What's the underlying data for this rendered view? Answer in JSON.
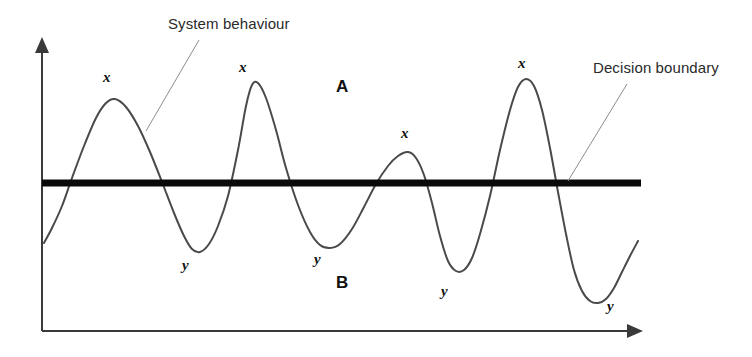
{
  "figure": {
    "background_color": "#ffffff"
  },
  "callouts": [
    {
      "name": "system-behaviour",
      "text": "System behaviour",
      "x": 168,
      "y": 16,
      "leader": {
        "x1": 199,
        "y1": 40,
        "x2": 146,
        "y2": 131
      },
      "color": "#2a2a2a"
    },
    {
      "name": "decision-boundary",
      "text": "Decision boundary",
      "x": 593,
      "y": 60,
      "leader": {
        "x1": 627,
        "y1": 84,
        "x2": 568,
        "y2": 181
      },
      "color": "#2a2a2a"
    }
  ],
  "regions": [
    {
      "name": "region-a",
      "text": "A",
      "x": 336,
      "y": 78
    },
    {
      "name": "region-b",
      "text": "B",
      "x": 336,
      "y": 274
    }
  ],
  "point_labels": [
    {
      "name": "peak-1",
      "text": "x",
      "x": 103,
      "y": 70
    },
    {
      "name": "trough-1",
      "text": "y",
      "x": 182,
      "y": 258
    },
    {
      "name": "peak-2",
      "text": "x",
      "x": 239,
      "y": 60
    },
    {
      "name": "trough-2",
      "text": "y",
      "x": 314,
      "y": 252
    },
    {
      "name": "peak-3",
      "text": "x",
      "x": 401,
      "y": 126
    },
    {
      "name": "trough-3",
      "text": "y",
      "x": 441,
      "y": 284
    },
    {
      "name": "peak-4",
      "text": "x",
      "x": 518,
      "y": 56
    },
    {
      "name": "trough-4",
      "text": "y",
      "x": 607,
      "y": 299
    }
  ],
  "axes": {
    "color": "#3a3a3a",
    "stroke_width": 2,
    "y_axis": {
      "x": 42,
      "y_top": 37,
      "y_bottom": 331
    },
    "x_axis": {
      "y": 331,
      "x_left": 42,
      "x_right": 643
    }
  },
  "chart_data": {
    "type": "line",
    "xlabel": "",
    "ylabel": "",
    "grid": false,
    "legend": "none",
    "series": [
      {
        "name": "System behaviour",
        "color": "#4a4a4a",
        "stroke_width": 2,
        "points": [
          [
            44,
            243
          ],
          [
            52,
            228
          ],
          [
            62,
            206
          ],
          [
            72,
            178
          ],
          [
            84,
            146
          ],
          [
            96,
            118
          ],
          [
            106,
            103
          ],
          [
            115,
            99
          ],
          [
            126,
            107
          ],
          [
            138,
            126
          ],
          [
            150,
            152
          ],
          [
            162,
            182
          ],
          [
            174,
            213
          ],
          [
            184,
            236
          ],
          [
            192,
            249
          ],
          [
            200,
            252
          ],
          [
            209,
            244
          ],
          [
            218,
            226
          ],
          [
            228,
            196
          ],
          [
            238,
            150
          ],
          [
            246,
            106
          ],
          [
            252,
            85
          ],
          [
            258,
            83
          ],
          [
            266,
            98
          ],
          [
            276,
            130
          ],
          [
            286,
            168
          ],
          [
            298,
            205
          ],
          [
            310,
            232
          ],
          [
            320,
            245
          ],
          [
            330,
            248
          ],
          [
            340,
            244
          ],
          [
            352,
            229
          ],
          [
            364,
            207
          ],
          [
            376,
            184
          ],
          [
            388,
            166
          ],
          [
            398,
            156
          ],
          [
            408,
            152
          ],
          [
            416,
            158
          ],
          [
            424,
            175
          ],
          [
            432,
            203
          ],
          [
            440,
            236
          ],
          [
            448,
            261
          ],
          [
            456,
            271
          ],
          [
            464,
            270
          ],
          [
            472,
            258
          ],
          [
            480,
            234
          ],
          [
            490,
            196
          ],
          [
            500,
            150
          ],
          [
            510,
            110
          ],
          [
            518,
            87
          ],
          [
            526,
            79
          ],
          [
            534,
            86
          ],
          [
            542,
            110
          ],
          [
            550,
            148
          ],
          [
            558,
            192
          ],
          [
            566,
            234
          ],
          [
            574,
            270
          ],
          [
            582,
            291
          ],
          [
            590,
            301
          ],
          [
            598,
            303
          ],
          [
            606,
            299
          ],
          [
            614,
            288
          ],
          [
            622,
            272
          ],
          [
            630,
            256
          ],
          [
            638,
            241
          ]
        ]
      }
    ],
    "decision_boundary": {
      "name": "Decision boundary",
      "type": "horizontal-line",
      "y": 183,
      "x_start": 42,
      "x_end": 641,
      "stroke_width": 7,
      "color": "#0a0a0a"
    }
  }
}
